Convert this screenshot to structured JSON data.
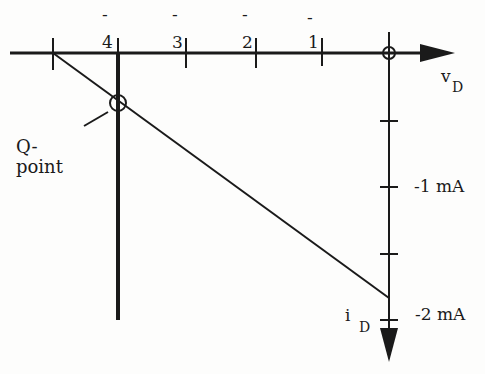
{
  "diagram": {
    "x_axis": {
      "label": "v",
      "label_sub": "D",
      "ticks": [
        {
          "text": "4",
          "minus": "-"
        },
        {
          "text": "3",
          "minus": "-"
        },
        {
          "text": "2",
          "minus": "-"
        },
        {
          "text": "1",
          "minus": "-"
        }
      ]
    },
    "y_axis": {
      "label": "i",
      "label_sub": "D",
      "ticks": [
        "-1 mA",
        "-2 mA"
      ]
    },
    "q_point": {
      "line1": "Q-",
      "line2": "point"
    },
    "colors": {
      "ink": "#1a1a1a",
      "background": "#fdfdfc"
    }
  }
}
